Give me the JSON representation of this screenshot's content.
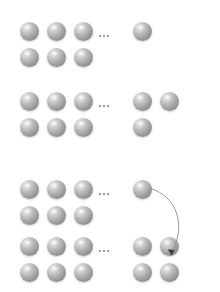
{
  "diagram": {
    "background_color": "#ffffff",
    "sphere": {
      "label": "sphere",
      "diameter_px": 19,
      "highlight_color": "#f2f2f2",
      "mid_color": "#a2a2a2",
      "shadow_color": "#7e7e7e"
    },
    "ellipsis": {
      "label": "...",
      "dot_color": "#9a9a9a",
      "dot_count": 3
    },
    "arrow": {
      "label": "mapping-arrow",
      "color": "#8f8f8f",
      "head_color": "#4a4a4a",
      "from": "block-3 row-1 right sphere",
      "to": "block-3 row-4 rightmost sphere"
    },
    "blocks": [
      {
        "name": "block-1",
        "rows": [
          {
            "left_spheres": [
              20,
              47,
              74
            ],
            "right_spheres": [
              133
            ]
          },
          {
            "left_spheres": [
              20,
              47,
              74
            ],
            "right_spheres": []
          }
        ],
        "row_y": [
          22,
          48
        ],
        "ellipsis_y": 35,
        "ellipsis_x": 99
      },
      {
        "name": "block-2",
        "rows": [
          {
            "left_spheres": [
              20,
              47,
              74
            ],
            "right_spheres": [
              133,
              160
            ]
          },
          {
            "left_spheres": [
              20,
              47,
              74
            ],
            "right_spheres": [
              133
            ]
          }
        ],
        "row_y": [
          92,
          118
        ],
        "ellipsis_y": 105,
        "ellipsis_x": 99
      },
      {
        "name": "block-3",
        "rows": [
          {
            "left_spheres": [
              20,
              47,
              74
            ],
            "right_spheres": [
              133
            ]
          },
          {
            "left_spheres": [
              20,
              47,
              74
            ],
            "right_spheres": []
          },
          {
            "left_spheres": [
              20,
              47,
              74
            ],
            "right_spheres": [
              133,
              160
            ]
          },
          {
            "left_spheres": [
              20,
              47,
              74
            ],
            "right_spheres": [
              133,
              160
            ]
          }
        ],
        "row_y": [
          180,
          206,
          237,
          263
        ],
        "ellipsis_y": [
          193,
          250
        ],
        "ellipsis_x": 99
      }
    ]
  }
}
